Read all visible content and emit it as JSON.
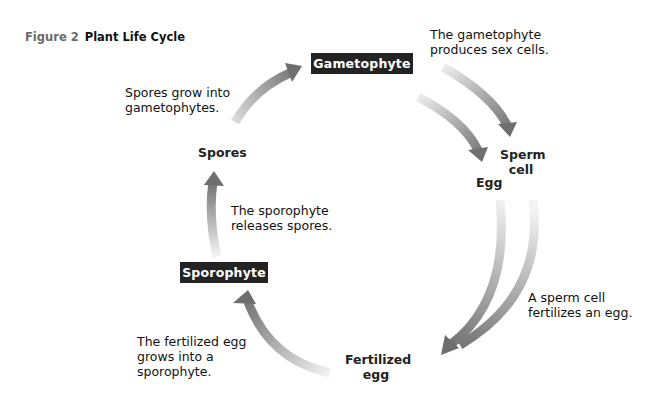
{
  "figure": {
    "number": "Figure 2",
    "title": "Plant Life Cycle"
  },
  "stages": {
    "gametophyte": "Gametophyte",
    "sporophyte": "Sporophyte",
    "spores": "Spores",
    "sperm_cell_line1": "Sperm",
    "sperm_cell_line2": "cell",
    "egg": "Egg",
    "fertilized_egg_line1": "Fertilized",
    "fertilized_egg_line2": "egg"
  },
  "captions": {
    "gametophyte_produces": [
      "The gametophyte",
      "produces sex cells."
    ],
    "spores_grow": [
      "Spores grow into",
      "gametophytes."
    ],
    "sporophyte_releases": [
      "The sporophyte",
      "releases spores."
    ],
    "sperm_fertilizes": [
      "A sperm cell",
      "fertilizes an egg."
    ],
    "fertilized_grows": [
      "The fertilized egg",
      "grows into a",
      "sporophyte."
    ]
  },
  "colors": {
    "box_background": "#232323",
    "box_text": "#ffffff",
    "arrow_dark": "#707070",
    "arrow_light": "#e8e8e8",
    "figure_number": "#6a6a6a"
  }
}
